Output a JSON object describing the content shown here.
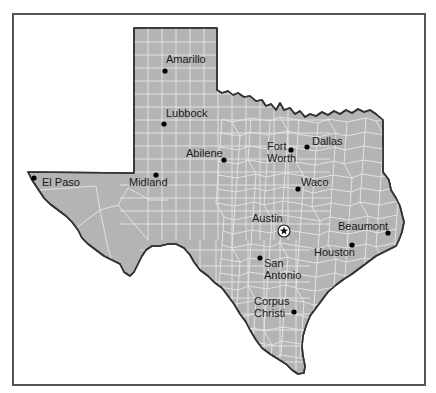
{
  "map": {
    "title": "Texas",
    "colors": {
      "land": "#b4b4b4",
      "county_lines": "#e6e6e6",
      "border": "#333333",
      "frame": "#555555",
      "city_dot": "#000000",
      "label": "#1a1a1a"
    },
    "capital": {
      "name": "Austin",
      "x": 284,
      "y": 231,
      "label_x": 252,
      "label_y": 222,
      "icon": "star-in-circle-icon"
    },
    "cities": [
      {
        "name": "Amarillo",
        "x": 165,
        "y": 71,
        "label_lines": [
          "Amarillo"
        ],
        "label_x": 166,
        "label_y": 63
      },
      {
        "name": "Lubbock",
        "x": 164,
        "y": 124,
        "label_lines": [
          "Lubbock"
        ],
        "label_x": 166,
        "label_y": 117
      },
      {
        "name": "Abilene",
        "x": 224,
        "y": 160,
        "label_lines": [
          "Abilene"
        ],
        "label_x": 186,
        "label_y": 157
      },
      {
        "name": "Midland",
        "x": 156,
        "y": 175,
        "label_lines": [
          "Midland"
        ],
        "label_x": 129,
        "label_y": 186
      },
      {
        "name": "El Paso",
        "x": 34,
        "y": 178,
        "label_lines": [
          "El Paso"
        ],
        "label_x": 42,
        "label_y": 186
      },
      {
        "name": "Fort Worth",
        "x": 291,
        "y": 150,
        "label_lines": [
          "Fort",
          "Worth"
        ],
        "label_x": 267,
        "label_y": 150
      },
      {
        "name": "Dallas",
        "x": 307,
        "y": 147,
        "label_lines": [
          "Dallas"
        ],
        "label_x": 312,
        "label_y": 145
      },
      {
        "name": "Waco",
        "x": 298,
        "y": 189,
        "label_lines": [
          "Waco"
        ],
        "label_x": 301,
        "label_y": 186
      },
      {
        "name": "Beaumont",
        "x": 388,
        "y": 233,
        "label_lines": [
          "Beaumont"
        ],
        "label_x": 338,
        "label_y": 230
      },
      {
        "name": "Houston",
        "x": 352,
        "y": 245,
        "label_lines": [
          "Houston"
        ],
        "label_x": 314,
        "label_y": 256
      },
      {
        "name": "San Antonio",
        "x": 260,
        "y": 258,
        "label_lines": [
          "San",
          "Antonio"
        ],
        "label_x": 264,
        "label_y": 267
      },
      {
        "name": "Corpus Christi",
        "x": 294,
        "y": 312,
        "label_lines": [
          "Corpus",
          "Christi"
        ],
        "label_x": 254,
        "label_y": 305
      }
    ]
  }
}
